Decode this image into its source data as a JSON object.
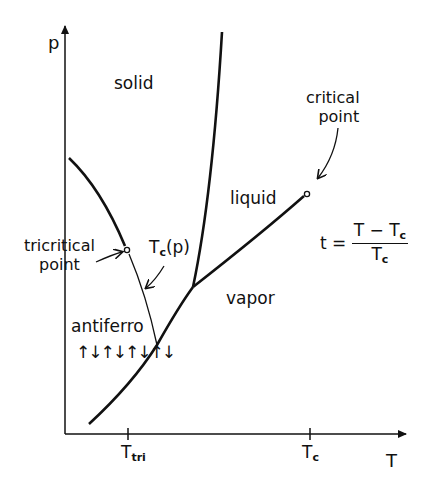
{
  "diagram": {
    "type": "phase-diagram",
    "axes": {
      "y_label": "p",
      "x_label": "T",
      "x_ticks": [
        {
          "base": "T",
          "sub": "tri"
        },
        {
          "base": "T",
          "sub": "c"
        }
      ]
    },
    "regions": {
      "solid": "solid",
      "liquid": "liquid",
      "vapor": "vapor",
      "antiferro": "antiferro",
      "spins": "↑↓↑↓↑↓↑↓"
    },
    "annotations": {
      "critical_point_line1": "critical",
      "critical_point_line2": "point",
      "tricritical_line1": "tricritical",
      "tricritical_line2": "point",
      "transition_line_base": "T",
      "transition_line_sub": "c",
      "transition_line_arg": "(p)"
    },
    "formula": {
      "lhs": "t =",
      "num_base": "T − T",
      "num_sub": "c",
      "den_base": "T",
      "den_sub": "c"
    },
    "colors": {
      "ink": "#111111",
      "background": "#ffffff"
    }
  }
}
